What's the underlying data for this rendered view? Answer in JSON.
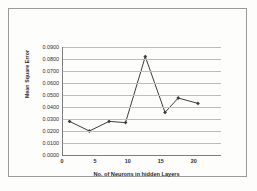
{
  "chart_data": {
    "type": "line",
    "title": "",
    "xlabel": "No. of Neurons in hidden Layers",
    "ylabel": "Mean Square Error",
    "xlim": [
      0,
      24
    ],
    "ylim": [
      0.0,
      0.09
    ],
    "grid": true,
    "legend": false,
    "marker": "diamond",
    "line_color": "#3d3d3d",
    "grid_color": "#bdbdbd",
    "axis_color": "#7d7d7d",
    "x": [
      1,
      4,
      7,
      9.5,
      12.5,
      15.5,
      17.5,
      20.5
    ],
    "values": [
      0.028,
      0.02,
      0.028,
      0.027,
      0.082,
      0.0355,
      0.0475,
      0.043
    ],
    "xticks": [
      0,
      5,
      10,
      15,
      20
    ],
    "xtick_labels": [
      "0",
      "5",
      "10",
      "15",
      "20"
    ],
    "yticks": [
      0.0,
      0.01,
      0.02,
      0.03,
      0.04,
      0.05,
      0.06,
      0.07,
      0.08,
      0.09
    ],
    "ytick_labels": [
      "0.0000",
      "0.0100",
      "0.0200",
      "0.0300",
      "0.0400",
      "0.0500",
      "0.0600",
      "0.0700",
      "0.0800",
      "0.0900"
    ]
  }
}
